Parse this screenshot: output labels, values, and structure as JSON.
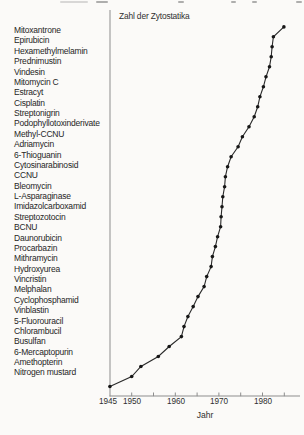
{
  "page": {
    "background": "#fbfaf8"
  },
  "drug_list": {
    "items": [
      "Mitoxantrone",
      "Epirubicin",
      "Hexamethylmelamin",
      "Prednimustin",
      "Vindesin",
      "Mitomycin C",
      "Estracyt",
      "Cisplatin",
      "Streptonigrin",
      "Podophyllotoxinderivate",
      "Methyl-CCNU",
      "Adriamycin",
      "6-Thioguanin",
      "Cytosinarabinosid",
      "CCNU",
      "Bleomycin",
      "L-Asparaginase",
      "Imidazolcarboxamid",
      "Streptozotocin",
      "BCNU",
      "Daunorubicin",
      "Procarbazin",
      "Mithramycin",
      "Hydroxyurea",
      "Vincristin",
      "Melphalan",
      "Cyclophosphamid",
      "Vinblastin",
      "5-Fluorouracil",
      "Chlorambucil",
      "Busulfan",
      "6-Mercaptopurin",
      "Amethopterin",
      "Nitrogen mustard"
    ]
  },
  "chart_data": {
    "type": "line",
    "title": "Zahl der Zytostatika",
    "xlabel": "Jahr",
    "ylabel": "",
    "legend": "none",
    "grid": false,
    "marker": "filled-dot",
    "x_tick_labels": [
      "1945",
      "1950",
      "1960",
      "1970",
      "1980"
    ],
    "x_tick_label_years": [
      1945,
      1950,
      1960,
      1970,
      1980
    ],
    "x_minor_tick_years": [
      1950,
      1955,
      1960,
      1965,
      1970,
      1975,
      1980,
      1985
    ],
    "x_axis_range_years": [
      1945,
      1988.5
    ],
    "series": [
      {
        "name": "Kumulative Zahl der Zytostatika",
        "points": [
          {
            "year": 1945.0,
            "count": 1
          },
          {
            "year": 1950.0,
            "count": 2
          },
          {
            "year": 1952.1,
            "count": 3
          },
          {
            "year": 1956.1,
            "count": 4
          },
          {
            "year": 1958.6,
            "count": 5
          },
          {
            "year": 1961.4,
            "count": 6
          },
          {
            "year": 1962.0,
            "count": 7
          },
          {
            "year": 1962.9,
            "count": 8
          },
          {
            "year": 1964.1,
            "count": 9
          },
          {
            "year": 1965.2,
            "count": 10
          },
          {
            "year": 1966.6,
            "count": 11
          },
          {
            "year": 1967.2,
            "count": 12
          },
          {
            "year": 1968.2,
            "count": 13
          },
          {
            "year": 1968.5,
            "count": 14
          },
          {
            "year": 1969.2,
            "count": 15
          },
          {
            "year": 1969.7,
            "count": 16
          },
          {
            "year": 1970.4,
            "count": 17
          },
          {
            "year": 1970.5,
            "count": 18
          },
          {
            "year": 1970.7,
            "count": 19
          },
          {
            "year": 1970.9,
            "count": 20
          },
          {
            "year": 1971.3,
            "count": 21
          },
          {
            "year": 1971.5,
            "count": 22
          },
          {
            "year": 1972.0,
            "count": 23
          },
          {
            "year": 1972.8,
            "count": 24
          },
          {
            "year": 1974.4,
            "count": 25
          },
          {
            "year": 1975.4,
            "count": 26
          },
          {
            "year": 1976.9,
            "count": 27
          },
          {
            "year": 1978.1,
            "count": 28
          },
          {
            "year": 1978.9,
            "count": 29
          },
          {
            "year": 1979.4,
            "count": 30
          },
          {
            "year": 1980.2,
            "count": 31
          },
          {
            "year": 1980.8,
            "count": 32
          },
          {
            "year": 1981.6,
            "count": 33
          },
          {
            "year": 1982.0,
            "count": 34
          },
          {
            "year": 1982.2,
            "count": 35
          },
          {
            "year": 1982.5,
            "count": 36
          },
          {
            "year": 1984.9,
            "count": 37
          }
        ]
      }
    ],
    "colors": {
      "line": "#2a2a2a",
      "dot": "#161616",
      "axis": "#8d8d8d",
      "text": "#2f2f2f"
    }
  }
}
